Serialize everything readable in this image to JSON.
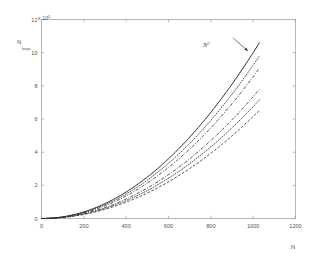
{
  "figure": {
    "background_color": "#ffffff",
    "axis_color": "#9a9a9a",
    "curve_color": "#2b2b2b"
  },
  "axes": {
    "y_label_main": "N",
    "y_label_sub": "keys",
    "x_label": "N",
    "exponent_prefix": "x 10",
    "exponent_power": "5",
    "x_ticks": [
      "0",
      "200",
      "400",
      "600",
      "800",
      "1000",
      "1200"
    ],
    "y_ticks": [
      "0",
      "2",
      "4",
      "6",
      "8",
      "10",
      "12"
    ]
  },
  "annotations": [
    {
      "text": "N",
      "superscript": "2",
      "name": "n-squared-annotation"
    }
  ],
  "chart_data": {
    "type": "line",
    "title": "",
    "xlabel": "N",
    "ylabel": "N keys",
    "xlim": [
      0,
      1200
    ],
    "ylim": [
      0,
      1200000
    ],
    "y_tick_multiplier": 100000,
    "y_tick_multiplier_text": "x 10^5",
    "x_ticks": [
      0,
      200,
      400,
      600,
      800,
      1000,
      1200
    ],
    "y_ticks": [
      0,
      200000,
      400000,
      600000,
      800000,
      1000000,
      1200000
    ],
    "grid": false,
    "legend": null,
    "x_data_max": 1030,
    "annotations": [
      {
        "label": "N^2",
        "points_to_series": "N^2",
        "arrow_from_x": 905,
        "arrow_from_y": 1090000,
        "arrow_to_x": 975,
        "arrow_to_y": 1010000
      }
    ],
    "x": [
      0,
      100,
      200,
      300,
      400,
      500,
      600,
      700,
      800,
      900,
      1000,
      1030
    ],
    "series": [
      {
        "name": "N^2",
        "style": "solid",
        "coefficient": 1.0,
        "values": [
          0,
          10000,
          40000,
          90000,
          160000,
          250000,
          360000,
          490000,
          640000,
          810000,
          1000000,
          1060900
        ]
      },
      {
        "name": "curve-2",
        "style": "dotted",
        "coefficient": 0.925,
        "values": [
          0,
          9250,
          37000,
          83250,
          148000,
          231250,
          333000,
          453250,
          592000,
          749250,
          925000,
          981332
        ]
      },
      {
        "name": "curve-3",
        "style": "dashdot",
        "coefficient": 0.855,
        "values": [
          0,
          8550,
          34200,
          76950,
          136800,
          213750,
          307800,
          418950,
          547200,
          692550,
          855000,
          907070
        ]
      },
      {
        "name": "curve-4",
        "style": "dashdot",
        "coefficient": 0.735,
        "values": [
          0,
          7350,
          29400,
          66150,
          117600,
          183750,
          264600,
          360150,
          470400,
          595350,
          735000,
          779762
        ]
      },
      {
        "name": "curve-5",
        "style": "dotted",
        "coefficient": 0.675,
        "values": [
          0,
          6750,
          27000,
          60750,
          108000,
          168750,
          243000,
          330750,
          432000,
          546750,
          675000,
          716108
        ]
      },
      {
        "name": "curve-6",
        "style": "dashed",
        "coefficient": 0.615,
        "values": [
          0,
          6150,
          24600,
          55350,
          98400,
          153750,
          221400,
          301350,
          393600,
          498150,
          615000,
          652454
        ]
      }
    ]
  }
}
